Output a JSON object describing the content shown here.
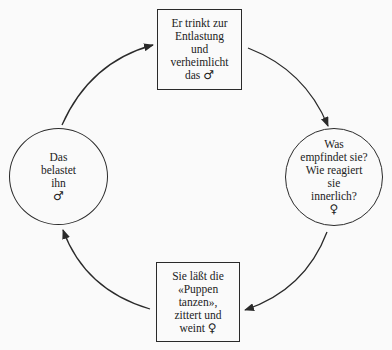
{
  "diagram": {
    "type": "cycle",
    "nodes": [
      {
        "id": "top",
        "shape": "box",
        "lines": [
          "Er trinkt zur",
          "Entlastung",
          "und",
          "verheimlicht",
          "das"
        ],
        "symbol": "♂"
      },
      {
        "id": "right",
        "shape": "circle",
        "lines": [
          "Was",
          "empfindet sie?",
          "Wie reagiert",
          "sie",
          "innerlich?"
        ],
        "symbol": "♀"
      },
      {
        "id": "bottom",
        "shape": "box",
        "lines": [
          "Sie läßt die",
          "«Puppen",
          "tanzen»,",
          "zittert und",
          "weint"
        ],
        "symbol": "♀"
      },
      {
        "id": "left",
        "shape": "circle",
        "lines": [
          "Das",
          "belastet",
          "ihn"
        ],
        "symbol": "♂"
      }
    ],
    "edges": [
      {
        "from": "top",
        "to": "right"
      },
      {
        "from": "right",
        "to": "bottom"
      },
      {
        "from": "bottom",
        "to": "left"
      },
      {
        "from": "left",
        "to": "top"
      }
    ],
    "colors": {
      "stroke": "#2a2a2a",
      "background": "#fafafa"
    }
  }
}
